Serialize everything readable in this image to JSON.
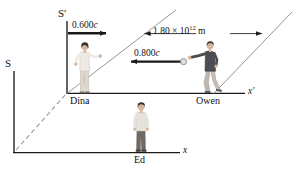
{
  "figure": {
    "type": "physics-spacetime-reference-frame-diagram",
    "background_color": "#ffffff",
    "ink_color": "#111111"
  },
  "frames": {
    "lab_frame_label": "S",
    "moving_frame_label": "S′"
  },
  "axes": {
    "x_label": "x",
    "x_prime_label": "x′"
  },
  "people": [
    {
      "name": "Dina",
      "label": "Dina"
    },
    {
      "name": "Owen",
      "label": "Owen"
    },
    {
      "name": "Ed",
      "label": "Ed"
    }
  ],
  "annotations": {
    "frame_velocity": {
      "value": "0.600",
      "unit": "c",
      "text": "0.600c",
      "direction": "right"
    },
    "ball_velocity": {
      "value": "0.800",
      "unit": "c",
      "text": "0.800c",
      "direction": "left"
    },
    "separation": {
      "mantissa": "1.80",
      "times": "×",
      "base": "10",
      "exponent": "12",
      "unit": "m",
      "text": "1.80 × 10¹² m"
    }
  },
  "colors": {
    "line": "#1a1a1a",
    "diagonal": "#8a8a8a",
    "dashed": "#9a9a9a",
    "skin": "#d6b49a",
    "dina_shirt": "#ece7e1",
    "dina_pants": "#dcd6cd",
    "owen_shirt": "#4b4b52",
    "owen_pants": "#b9b3ab",
    "ed_shirt": "#e2e0da",
    "ed_pants": "#6f6a66",
    "hair_dark": "#3a3230",
    "ball": "#d9d9d9"
  }
}
